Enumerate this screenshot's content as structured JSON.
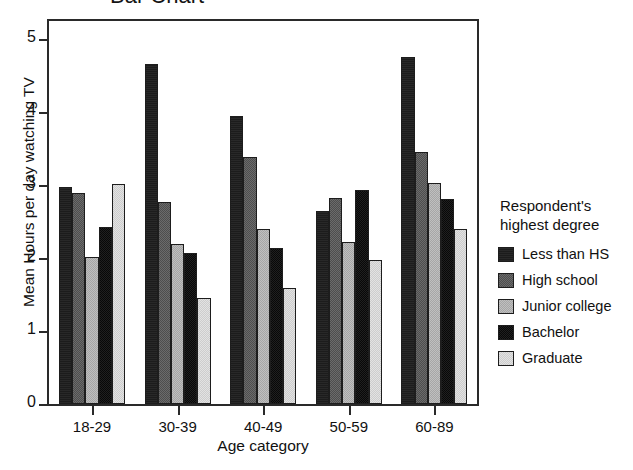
{
  "figure": {
    "cropped_title": "Bar Chart"
  },
  "chart_data": {
    "type": "bar",
    "title": "",
    "xlabel": "Age category",
    "ylabel": "Mean Hours per day watching TV",
    "categories": [
      "18-29",
      "30-39",
      "40-49",
      "50-59",
      "60-89"
    ],
    "ylim": [
      0,
      5.25
    ],
    "yticks": [
      0,
      1,
      2,
      3,
      4,
      5
    ],
    "ytick_labels": [
      "0",
      "1",
      "2",
      "3",
      "4",
      "5"
    ],
    "grid": false,
    "legend_position": "right",
    "legend_title": "Respondent's highest degree",
    "series": [
      {
        "name": "Less than HS",
        "color": "#1c1c1c",
        "values": [
          2.97,
          4.66,
          3.95,
          2.65,
          4.76
        ]
      },
      {
        "name": "High school",
        "color": "#5c5c5c",
        "values": [
          2.89,
          2.77,
          3.38,
          2.82,
          3.45
        ]
      },
      {
        "name": "Junior college",
        "color": "#b2b2b2",
        "values": [
          2.01,
          2.19,
          2.4,
          2.22,
          3.03
        ]
      },
      {
        "name": "Bachelor",
        "color": "#131313",
        "values": [
          2.43,
          2.07,
          2.14,
          2.94,
          2.81
        ]
      },
      {
        "name": "Graduate",
        "color": "#d8d8d8",
        "values": [
          3.01,
          1.45,
          1.59,
          1.97,
          2.4
        ]
      }
    ]
  }
}
